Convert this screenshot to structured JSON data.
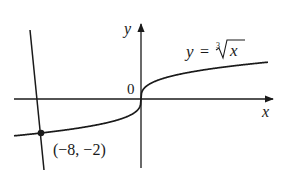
{
  "chart_data": {
    "type": "line",
    "title": "",
    "function_label": "y = ∛x",
    "function_label_parts": {
      "lhs": "y",
      "eq": "=",
      "index": "3",
      "radicand": "x"
    },
    "xlabel": "x",
    "ylabel": "y",
    "origin_label": "0",
    "grid": false,
    "legend": "none",
    "series": [
      {
        "name": "y = cube root of x",
        "x": [
          -8.8,
          -8,
          -6,
          -4,
          -2,
          -1,
          -0.5,
          -0.1,
          0,
          0.1,
          0.5,
          1,
          2,
          4,
          6,
          8,
          10.1
        ],
        "values": [
          -2.064,
          -2,
          -1.817,
          -1.587,
          -1.26,
          -1,
          -0.794,
          -0.464,
          0,
          0.464,
          0.794,
          1,
          1.26,
          1.587,
          1.817,
          2,
          2.162
        ]
      },
      {
        "name": "steep line through (-8, -2)",
        "x": [
          -8.88,
          -7.76
        ],
        "values": [
          4.06,
          -4.24
        ]
      }
    ],
    "annotations": [
      {
        "text": "(−8, −2)",
        "x": -8,
        "y": -2,
        "marker": "filled-dot"
      }
    ],
    "xlim": [
      -10.2,
      10.8
    ],
    "ylim": [
      -4.7,
      3.7
    ]
  },
  "colors": {
    "ink": "#1a1a1a",
    "background": "#ffffff"
  }
}
